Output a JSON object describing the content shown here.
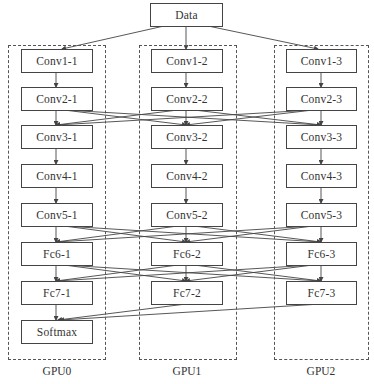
{
  "diagram": {
    "title_node": "Data",
    "columns": [
      {
        "gpu_label": "GPU0",
        "nodes": [
          "Conv1-1",
          "Conv2-1",
          "Conv3-1",
          "Conv4-1",
          "Conv5-1",
          "Fc6-1",
          "Fc7-1",
          "Softmax"
        ]
      },
      {
        "gpu_label": "GPU1",
        "nodes": [
          "Conv1-2",
          "Conv2-2",
          "Conv3-2",
          "Conv4-2",
          "Conv5-2",
          "Fc6-2",
          "Fc7-2"
        ]
      },
      {
        "gpu_label": "GPU2",
        "nodes": [
          "Conv1-3",
          "Conv2-3",
          "Conv3-3",
          "Conv4-3",
          "Conv5-3",
          "Fc6-3",
          "Fc7-3"
        ]
      }
    ],
    "cross_connections": [
      {
        "from_layer": "Conv2",
        "to_layer": "Conv3",
        "type": "all-to-all"
      },
      {
        "from_layer": "Conv5",
        "to_layer": "Fc6",
        "type": "all-to-all"
      },
      {
        "from_layer": "Fc6",
        "to_layer": "Fc7",
        "type": "all-to-all"
      },
      {
        "from_layer": "Fc7",
        "to_layer": "Softmax",
        "type": "all-to-one"
      }
    ],
    "colors": {
      "line": "#444444",
      "frame": "#555555",
      "text": "#333333"
    }
  }
}
